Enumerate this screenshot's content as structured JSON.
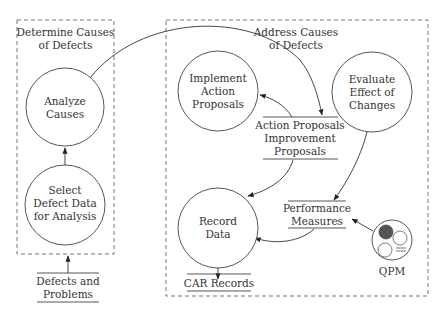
{
  "diagram": {
    "groups": [
      {
        "id": "determine",
        "title": [
          "Determine Causes",
          "of Defects"
        ]
      },
      {
        "id": "address",
        "title": [
          "Address Causes",
          "of Defects"
        ]
      }
    ],
    "processes": [
      {
        "id": "analyze",
        "lines": [
          "Analyze",
          "Causes"
        ]
      },
      {
        "id": "select",
        "lines": [
          "Select",
          "Defect Data",
          "for Analysis"
        ]
      },
      {
        "id": "implement",
        "lines": [
          "Implement",
          "Action",
          "Proposals"
        ]
      },
      {
        "id": "evaluate",
        "lines": [
          "Evaluate",
          "Effect of",
          "Changes"
        ]
      },
      {
        "id": "record",
        "lines": [
          "Record",
          "Data"
        ]
      }
    ],
    "stores": [
      {
        "id": "defects",
        "lines": [
          "Defects and",
          "Problems"
        ]
      },
      {
        "id": "proposals",
        "lines": [
          "Action Proposals",
          "Improvement",
          "Proposals"
        ]
      },
      {
        "id": "measures",
        "lines": [
          "Performance",
          "Measures"
        ]
      },
      {
        "id": "car",
        "lines": [
          "CAR Records"
        ]
      }
    ],
    "external": {
      "id": "qpm",
      "label": "QPM"
    },
    "flows": [
      {
        "from": "defects",
        "to": "select"
      },
      {
        "from": "select",
        "to": "analyze"
      },
      {
        "from": "analyze",
        "to": "proposals"
      },
      {
        "from": "proposals",
        "to": "implement"
      },
      {
        "from": "proposals",
        "to": "record"
      },
      {
        "from": "evaluate",
        "to": "measures"
      },
      {
        "from": "measures",
        "to": "record"
      },
      {
        "from": "qpm",
        "to": "measures"
      },
      {
        "from": "record",
        "to": "car"
      }
    ],
    "colors": {
      "stroke": "#444444",
      "text": "#333333",
      "qpm_fill": "#555555"
    }
  }
}
